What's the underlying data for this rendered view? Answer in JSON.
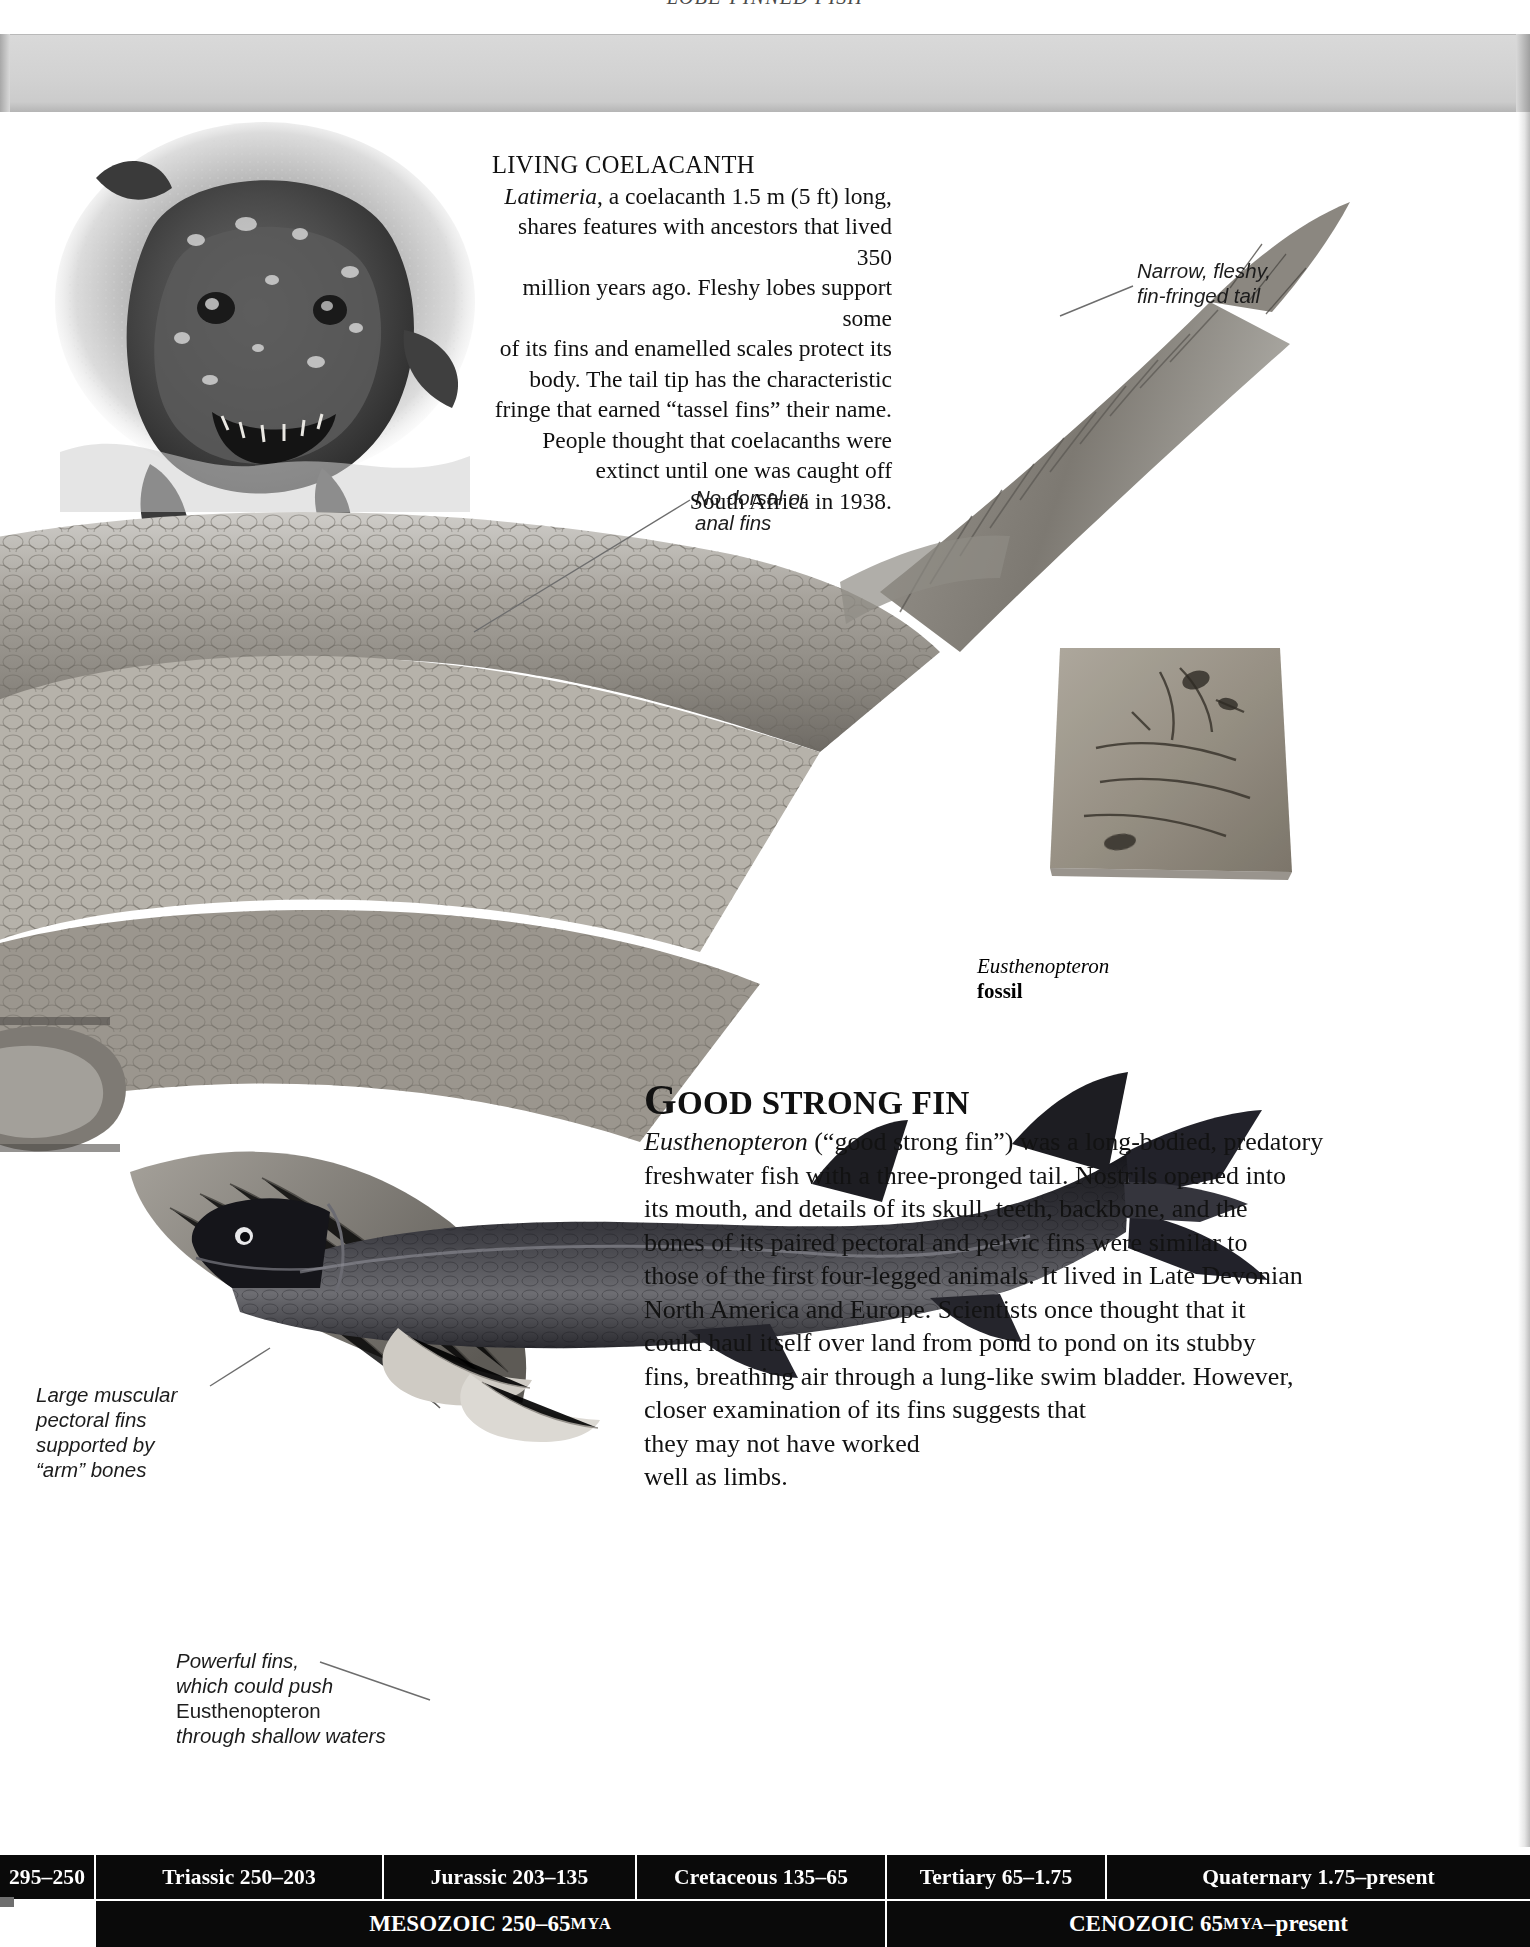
{
  "running_head": "LOBE-FINNED FISH",
  "coelacanth": {
    "title": "LIVING COELACANTH",
    "genus": "Latimeria",
    "lines": [
      ", a coelacanth 1.5 m (5 ft) long,",
      "shares features with ancestors that lived 350",
      "million years ago. Fleshy lobes support some",
      "of its fins and enamelled scales protect its",
      "body. The tail tip has the characteristic",
      "fringe that earned “tassel fins” their name.",
      "People thought that coelacanths were",
      "extinct until one was caught off",
      "South Africa in 1938."
    ]
  },
  "callouts": {
    "tail": [
      "Narrow, fleshy,",
      "fin-fringed tail"
    ],
    "no_fins": [
      "No dorsal or",
      "anal fins"
    ],
    "pectoral": [
      "Large muscular",
      "pectoral fins",
      "supported by",
      "“arm” bones"
    ],
    "power_fins_1": "Powerful fins,",
    "power_fins_2": "which could push",
    "power_fins_3": "Eusthenopteron",
    "power_fins_4": "through shallow waters"
  },
  "fossil_caption": {
    "genus": "Eusthenopteron",
    "word": "fossil"
  },
  "good_strong_fin": {
    "head_first": "G",
    "head_rest": "OOD",
    "head_word2": "STRONG",
    "head_word3": "FIN",
    "genus": "Eusthenopteron",
    "lines": [
      " (“good strong fin”) was a long-bodied, predatory",
      "freshwater fish with a three-pronged tail. Nostrils opened into",
      "its mouth, and details of its skull, teeth, backbone, and the",
      "bones of its paired pectoral and pelvic fins were similar to",
      "those of the first four-legged animals. It lived in Late Devonian",
      "North America and Europe. Scientists once thought that it",
      "could haul itself over land from pond to pond on its stubby",
      "fins, breathing air through a lung-like swim bladder. However,",
      "closer examination of its fins suggests that",
      "they may not have worked",
      "well as limbs."
    ]
  },
  "timeline": {
    "periods": [
      {
        "label": "295–250",
        "width": 96
      },
      {
        "label": "Triassic 250–203",
        "width": 288
      },
      {
        "label": "Jurassic 203–135",
        "width": 253
      },
      {
        "label": "Cretaceous 135–65",
        "width": 250
      },
      {
        "label": "Tertiary 65–1.75",
        "width": 220
      },
      {
        "label": "Quaternary 1.75–present",
        "width": 423
      }
    ],
    "eras": [
      {
        "gap": 96,
        "label_main": "MESOZOIC 250–65 ",
        "label_sc": "MYA",
        "width": 791
      },
      {
        "label_main": "CENOZOIC 65 ",
        "label_sc": "MYA",
        "label_tail": "–present",
        "width": 643
      }
    ],
    "accent_color": "#0a0a0a"
  }
}
